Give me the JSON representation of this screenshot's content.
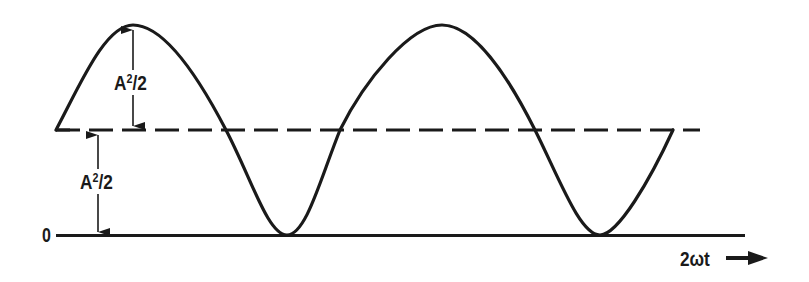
{
  "figure": {
    "colors": {
      "ink": "#1a1a1a",
      "background": "#ffffff"
    },
    "labels": {
      "upper_amplitude": {
        "base": "A",
        "exp": "2",
        "tail": "/2"
      },
      "lower_amplitude": {
        "base": "A",
        "exp": "2",
        "tail": "/2"
      },
      "zero": "0",
      "x_axis": "2ωt",
      "x_arrow": "→"
    },
    "reference_lines": [
      {
        "name": "mean-level",
        "style": "dashed",
        "value": "A²/2"
      },
      {
        "name": "zero-baseline",
        "style": "solid",
        "value": "0"
      }
    ],
    "curve": {
      "type": "raised-cosine",
      "cycles": 2,
      "start_phase": "mean level, rising",
      "end_phase": "mean level, rising",
      "peaks": 2,
      "troughs": 2
    }
  }
}
